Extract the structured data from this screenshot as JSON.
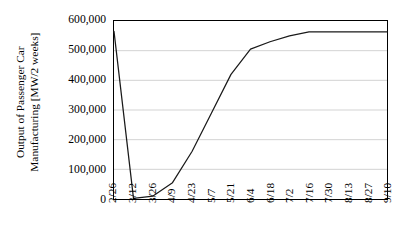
{
  "chart_data": {
    "type": "line",
    "title": "",
    "xlabel": "",
    "ylabel": "Output of Passenger Car Manufacturing [MW/2 weeks]",
    "ylabel_line1": "Output of Passenger Car",
    "ylabel_line2": "Manufacturing [MW/2 weeks]",
    "categories": [
      "2/26",
      "3/12",
      "3/26",
      "4/9",
      "4/23",
      "5/7",
      "5/21",
      "6/4",
      "6/18",
      "7/2",
      "7/16",
      "7/30",
      "8/13",
      "8/27",
      "9/10"
    ],
    "values": [
      565000,
      2000,
      10000,
      55000,
      160000,
      290000,
      420000,
      505000,
      530000,
      550000,
      563000,
      563000,
      563000,
      563000,
      563000
    ],
    "series": [
      {
        "name": "Output of Passenger Car Manufacturing",
        "values": [
          565000,
          2000,
          10000,
          55000,
          160000,
          290000,
          420000,
          505000,
          530000,
          550000,
          563000,
          563000,
          563000,
          563000,
          563000
        ]
      }
    ],
    "ylim": [
      0,
      600000
    ],
    "yticks": [
      0,
      100000,
      200000,
      300000,
      400000,
      500000,
      600000
    ],
    "ytick_labels": [
      "0",
      "100,000",
      "200,000",
      "300,000",
      "400,000",
      "500,000",
      "600,000"
    ],
    "grid": true,
    "grid_axis": "y",
    "legend": false,
    "legend_position": "none",
    "line_color": "#1a1a1a",
    "grid_color": "#bfbfbf",
    "frame_color": "#000000",
    "background_color": "#ffffff",
    "xtick_rotation": -90,
    "ylabel_rotation": -90
  }
}
